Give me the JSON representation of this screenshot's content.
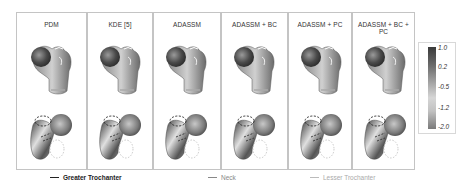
{
  "figure": {
    "panels": [
      {
        "title": "PDM",
        "x": 16,
        "w": 71
      },
      {
        "title": "KDE [5]",
        "x": 87,
        "w": 66
      },
      {
        "title": "ADASSM",
        "x": 153,
        "w": 68
      },
      {
        "title": "ADASSM + BC",
        "x": 221,
        "w": 67
      },
      {
        "title": "ADASSM + PC",
        "x": 288,
        "w": 64
      },
      {
        "title": "ADASSM + BC + PC",
        "x": 352,
        "w": 63
      }
    ],
    "colorbar": {
      "ticks": [
        "1.0",
        "0.2",
        "-0.5",
        "-1.2",
        "-2.0"
      ],
      "colors": [
        "#3a3a3a",
        "#a0a0a0",
        "#d6d6d6",
        "#7a7a7a"
      ]
    },
    "legend": [
      {
        "label": "Greater Trochanter",
        "color": "#222222",
        "weight": "bold"
      },
      {
        "label": "Neck",
        "color": "#888888",
        "weight": "normal"
      },
      {
        "label": "Lesser Trochanter",
        "color": "#b5b5b5",
        "weight": "normal"
      }
    ]
  }
}
